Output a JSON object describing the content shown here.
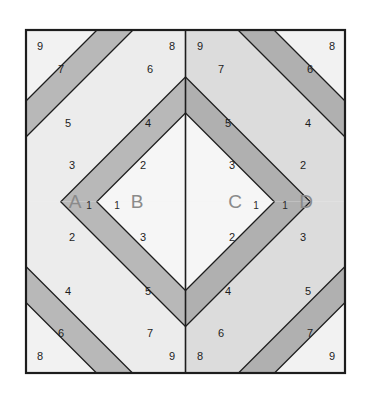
{
  "diagram": {
    "frame": {
      "x": 26,
      "y": 30,
      "width": 319,
      "height": 343
    },
    "colors": {
      "background": "#ffffff",
      "light_strip": "#f0f0f0",
      "mid_light_strip": "#e2e2e2",
      "medium_strip": "#b8b8b8",
      "dark_strip": "#a8a8a8",
      "outline": "#1d1d1d",
      "letter_text": "#8a8a8a",
      "number_text": "#1d1d1d"
    },
    "units": [
      {
        "id": "A",
        "letter": "A",
        "one_label": "1",
        "position": "top-left-inner",
        "mirror_x": false,
        "mirror_y": false
      },
      {
        "id": "B",
        "letter": "B",
        "one_label": "1",
        "position": "top-right-inner",
        "mirror_x": true,
        "mirror_y": false
      },
      {
        "id": "C",
        "letter": "C",
        "one_label": "1",
        "position": "bottom-left-inner",
        "mirror_x": false,
        "mirror_y": false
      },
      {
        "id": "D",
        "letter": "D",
        "one_label": "1",
        "position": "bottom-right-inner",
        "mirror_x": true,
        "mirror_y": false
      }
    ],
    "strip_numbers": [
      "1",
      "2",
      "3",
      "4",
      "5",
      "6",
      "7",
      "8",
      "9"
    ],
    "quadrant_labels": {
      "top_left": [
        "9",
        "7",
        "5",
        "3",
        "8",
        "6",
        "4",
        "2"
      ],
      "top_right": [
        "9",
        "7",
        "5",
        "3",
        "8",
        "6",
        "4",
        "2"
      ],
      "bottom_left": [
        "2",
        "4",
        "6",
        "8",
        "3",
        "5",
        "7",
        "9"
      ],
      "bottom_right": [
        "2",
        "4",
        "6",
        "8",
        "3",
        "5",
        "7",
        "9"
      ]
    }
  }
}
